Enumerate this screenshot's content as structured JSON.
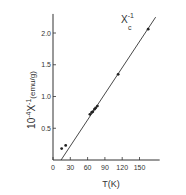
{
  "chart_data": {
    "type": "scatter",
    "title": "",
    "annotation": {
      "text": "X",
      "sub": "c",
      "sup": "-1"
    },
    "xlabel": "T(K)",
    "ylabel": {
      "prefix": "10",
      "exp": "-4",
      "sym": "X",
      "symexp": "-1",
      "unit": "(emu/g)"
    },
    "xlim": [
      0,
      185
    ],
    "ylim": [
      0,
      2.3
    ],
    "xticks": [
      0,
      30,
      60,
      90,
      120,
      150
    ],
    "yticks": [
      0.5,
      1.0,
      1.5,
      2.0
    ],
    "ytick_labels": [
      "0.5",
      "1.0",
      "1.5",
      "2.0"
    ],
    "grid": false,
    "series": [
      {
        "name": "data",
        "x": [
          15,
          22,
          64,
          67,
          69,
          72,
          74,
          77,
          113,
          165
        ],
        "y": [
          0.18,
          0.23,
          0.72,
          0.75,
          0.76,
          0.8,
          0.82,
          0.85,
          1.35,
          2.06
        ]
      },
      {
        "name": "fit",
        "type": "line",
        "x": [
          14,
          178
        ],
        "y": [
          0.0,
          2.25
        ]
      }
    ]
  }
}
